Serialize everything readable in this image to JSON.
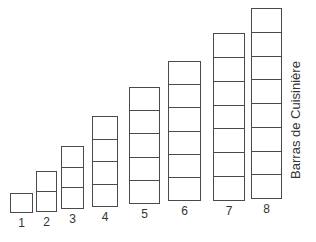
{
  "title": "Barras de Cuisinière",
  "bars": [
    {
      "label": "1",
      "cells": 1,
      "x": 10,
      "top": 193,
      "bottom": 213,
      "width": 23
    },
    {
      "label": "2",
      "cells": 2,
      "x": 36,
      "top": 171,
      "bottom": 212,
      "width": 21
    },
    {
      "label": "3",
      "cells": 3,
      "x": 61,
      "top": 146,
      "bottom": 209,
      "width": 23
    },
    {
      "label": "4",
      "cells": 4,
      "x": 92,
      "top": 116,
      "bottom": 207,
      "width": 26
    },
    {
      "label": "5",
      "cells": 5,
      "x": 129,
      "top": 87,
      "bottom": 204,
      "width": 31
    },
    {
      "label": "6",
      "cells": 6,
      "x": 168,
      "top": 61,
      "bottom": 201,
      "width": 33
    },
    {
      "label": "7",
      "cells": 7,
      "x": 213,
      "top": 33,
      "bottom": 201,
      "width": 32
    },
    {
      "label": "8",
      "cells": 8,
      "x": 251,
      "top": 8,
      "bottom": 199,
      "width": 31
    }
  ],
  "colors": {
    "stroke": "#4a4a4a",
    "text": "#333333",
    "background": "#ffffff"
  }
}
